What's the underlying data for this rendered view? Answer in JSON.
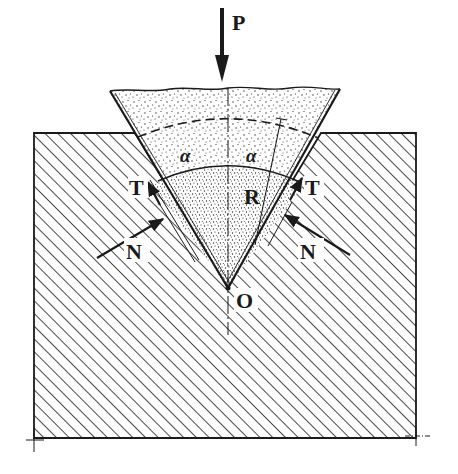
{
  "diagram": {
    "type": "mechanics-free-body",
    "colors": {
      "ink": "#1a1a1a",
      "background": "#ffffff",
      "stipple": "#2a2a2a"
    },
    "labels": {
      "load": "P",
      "resultant": "R",
      "apex": "O",
      "tangential_left": "T",
      "tangential_right": "T",
      "normal_left": "N",
      "normal_right": "N",
      "angle_left": "α",
      "angle_right": "α"
    },
    "elements": [
      {
        "name": "load-arrow",
        "label": "P",
        "direction": "down"
      },
      {
        "name": "wedge",
        "fill": "stippled",
        "half_angle_label": "α"
      },
      {
        "name": "solid-block",
        "fill": "diagonal-hatch"
      },
      {
        "name": "normal-force-left",
        "label": "N"
      },
      {
        "name": "normal-force-right",
        "label": "N"
      },
      {
        "name": "friction-force-left",
        "label": "T"
      },
      {
        "name": "friction-force-right",
        "label": "T"
      },
      {
        "name": "resultant-line",
        "label": "R"
      },
      {
        "name": "apex-point",
        "label": "O"
      }
    ]
  }
}
